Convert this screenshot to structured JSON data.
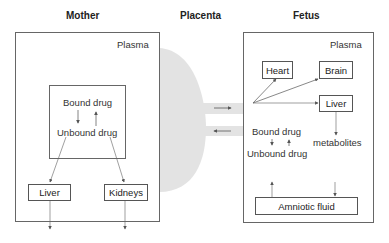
{
  "headers": {
    "mother": "Mother",
    "placenta": "Placenta",
    "fetus": "Fetus"
  },
  "mother": {
    "compartment_label": "Plasma",
    "drug_box": {
      "bound": "Bound drug",
      "unbound": "Unbound drug"
    },
    "organs": {
      "liver": "Liver",
      "kidneys": "Kidneys"
    }
  },
  "fetus": {
    "compartment_label": "Plasma",
    "organs": {
      "heart": "Heart",
      "brain": "Brain",
      "liver": "Liver"
    },
    "bound": "Bound drug",
    "unbound": "Unbound drug",
    "metabolites": "metabolites",
    "amniotic_fluid": "Amniotic fluid"
  },
  "colors": {
    "placenta_fill": "#e3e3e3",
    "line": "#666666",
    "text": "#222222"
  }
}
